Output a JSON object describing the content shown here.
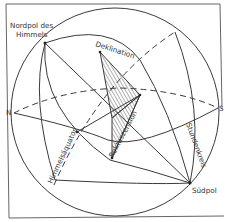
{
  "diagram": {
    "labels": {
      "north_pole": [
        "Nordpol des",
        "Himmels"
      ],
      "south_pole": "Südpol",
      "declination": "Deklination",
      "right_ascension": "Rektaszension",
      "hour_circle": "Stundenkreis",
      "celestial_equator": "Himmelsäquator",
      "north": "N",
      "south": "S"
    },
    "colors": {
      "line": "#3a3a3a",
      "frame": "#555555",
      "text": "#333333",
      "background": "#ffffff"
    }
  }
}
